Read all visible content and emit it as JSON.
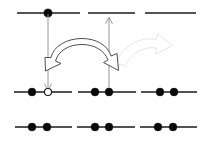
{
  "figure": {
    "canvas": {
      "width": 201,
      "height": 148
    },
    "background_color": "#ffffff",
    "line_color": "#1a1a1a",
    "filled_dot_color": "#0a0a0a",
    "hollow_dot_fill": "#ffffff",
    "guide_color": "#8c8c8c",
    "block_arrow_stroke": "#3a3a3a",
    "block_arrow_fill": "#ffffff",
    "ghost_arrow_stroke": "#e2e2e2"
  },
  "rows": [
    {
      "name": "top-row",
      "y": 13,
      "segments": [
        {
          "name": "top-segment-1",
          "x1": 17,
          "x2": 80,
          "dots": [
            {
              "type": "filled",
              "cx": 48
            }
          ]
        },
        {
          "name": "top-segment-2",
          "x1": 78,
          "x2": 135,
          "dots": []
        },
        {
          "name": "top-segment-3",
          "x1": 138,
          "x2": 196,
          "dots": []
        }
      ]
    },
    {
      "name": "middle-row",
      "y": 92,
      "segments": [
        {
          "name": "middle-segment-1",
          "x1": 14,
          "x2": 72,
          "dots": [
            {
              "type": "filled",
              "cx": 32
            },
            {
              "type": "hollow",
              "cx": 48
            }
          ]
        },
        {
          "name": "middle-segment-2",
          "x1": 78,
          "x2": 136,
          "dots": [
            {
              "type": "filled",
              "cx": 95
            },
            {
              "type": "filled",
              "cx": 109
            }
          ]
        },
        {
          "name": "middle-segment-3",
          "x1": 141,
          "x2": 197,
          "dots": [
            {
              "type": "filled",
              "cx": 160
            },
            {
              "type": "filled",
              "cx": 174
            }
          ]
        }
      ]
    },
    {
      "name": "bottom-row",
      "y": 127,
      "segments": [
        {
          "name": "bottom-segment-1",
          "x1": 15,
          "x2": 72,
          "dots": [
            {
              "type": "filled",
              "cx": 32
            },
            {
              "type": "filled",
              "cx": 47
            }
          ]
        },
        {
          "name": "bottom-segment-2",
          "x1": 77,
          "x2": 135,
          "dots": [
            {
              "type": "filled",
              "cx": 95
            },
            {
              "type": "filled",
              "cx": 109
            }
          ]
        },
        {
          "name": "bottom-segment-3",
          "x1": 140,
          "x2": 197,
          "dots": [
            {
              "type": "filled",
              "cx": 158
            },
            {
              "type": "filled",
              "cx": 173
            }
          ]
        }
      ]
    }
  ],
  "guides": [
    {
      "name": "down-guide-arrow",
      "direction": "down",
      "x": 48,
      "y_start": 14,
      "y_end": 89
    },
    {
      "name": "up-guide-arrow",
      "direction": "up",
      "x": 109,
      "y_start": 91,
      "y_end": 18
    }
  ],
  "arrows": [
    {
      "name": "primary-curved-block-arrow",
      "style": "double-headed-curved-block",
      "from_x": 46,
      "to_x": 118,
      "apex_y": 40,
      "color": "#3a3a3a"
    },
    {
      "name": "ghost-curved-block-arrow",
      "style": "curved-block-faded",
      "from_x": 118,
      "to_x": 182,
      "apex_y": 46,
      "color": "#e2e2e2"
    }
  ]
}
